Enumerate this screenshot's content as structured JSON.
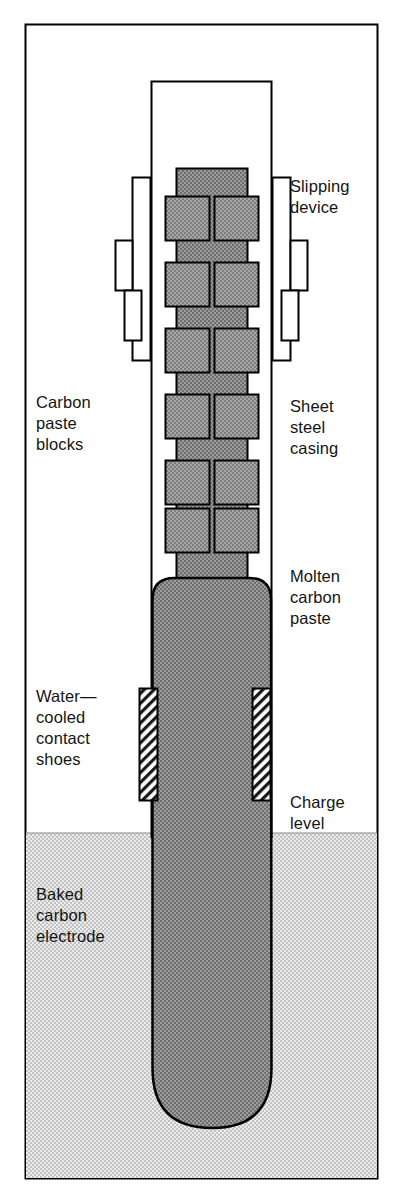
{
  "figure": {
    "type": "cross-section-diagram",
    "frame": {
      "x": 25,
      "y": 24,
      "width": 353,
      "height": 1155,
      "stroke": "#000000",
      "fill": "#ffffff"
    },
    "colors": {
      "outline": "#000000",
      "paste_fill": "#8c8c8c",
      "paste_block_fill": "#9a9a9a",
      "charge_fill": "#d9d9d9",
      "casing_fill": "#ffffff",
      "shoe_fill": "#ffffff",
      "label_text": "#141414",
      "page_background": "#ffffff"
    },
    "casing": {
      "x": 151,
      "y": 81,
      "width": 121,
      "height": 756,
      "label": "sheet-steel-casing"
    },
    "paste_column": {
      "x": 176,
      "y": 168,
      "width": 72,
      "label": "carbon-paste-column"
    },
    "molten_body": {
      "x": 152,
      "y": 578,
      "width": 119,
      "bottom": 1128,
      "corner_radius": 22,
      "tip_radius": 60
    },
    "charge_level_y": 833,
    "paste_block_rows": 6,
    "paste_block": {
      "width": 44,
      "height": 44,
      "gap": 10,
      "row_pitch": 66,
      "first_row_y": 196
    },
    "contact_shoes": {
      "y": 688,
      "height": 112,
      "width": 19,
      "left_x": 139,
      "right_x": 252,
      "hatch": "diagonal"
    },
    "slipping_brackets": {
      "top": 176,
      "height": 186,
      "left_x": 130,
      "right_x": 265,
      "arm_width": 26
    }
  },
  "labels": {
    "slipping_device": "Slipping\ndevice",
    "sheet_steel_casing": "Sheet\nsteel\ncasing",
    "molten_carbon_paste": "Molten\ncarbon\npaste",
    "charge_level": "Charge\nlevel",
    "carbon_paste_blocks": "Carbon\npaste\nblocks",
    "water_cooled_contact_shoes": "Water—\ncooled\ncontact\nshoes",
    "baked_carbon_electrode": "Baked\ncarbon\nelectrode"
  }
}
